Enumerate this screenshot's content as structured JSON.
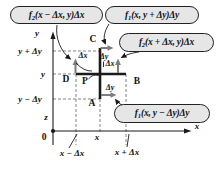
{
  "colors": {
    "background": "#ffffff",
    "line": "#1a1a1a",
    "dashed": "#666666",
    "arrow": "#7d7d7d",
    "bubble_fill": "#e6e6e6",
    "bubble_border": "#222222",
    "text": "#111111"
  },
  "callouts": [
    {
      "fname": "f",
      "sub": "2",
      "args": "(x − Δx, y)Δx"
    },
    {
      "fname": "f",
      "sub": "1",
      "args": "(x, y + Δy)Δy"
    },
    {
      "fname": "f",
      "sub": "2",
      "args": "(x + Δx, y)Δx"
    },
    {
      "fname": "f",
      "sub": "1",
      "args": "(x, y − Δy)Δy"
    }
  ],
  "axes": {
    "x": "x",
    "y": "y",
    "z": "z",
    "origin": "0"
  },
  "y_ticks": [
    {
      "label": "y + Δy"
    },
    {
      "label": "y"
    },
    {
      "label": "y − Δy"
    }
  ],
  "x_ticks": [
    {
      "label": "x − Δx"
    },
    {
      "label": "x"
    },
    {
      "label": "x + Δx"
    }
  ],
  "points": {
    "top": "C",
    "left": "D",
    "right": "B",
    "bottom": "A",
    "center": "P"
  },
  "segments": {
    "dx_left": "Δx",
    "dy_top": "Δy",
    "dx_right": "Δx",
    "dy_bottom": "Δy"
  }
}
